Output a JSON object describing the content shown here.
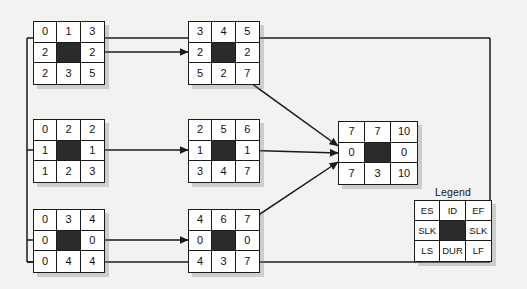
{
  "diagram": {
    "type": "activity-on-node-network",
    "title": "",
    "background_color": "#f2f2f0",
    "node_border_color": "#1a1a1a",
    "dark_cell_color": "#2b2b2b",
    "line_color": "#1a1a1a"
  },
  "legend": {
    "title": "Legend",
    "cells": [
      "ES",
      "ID",
      "EF",
      "SLK",
      "",
      "SLK",
      "LS",
      "DUR",
      "LF"
    ],
    "meaning": {
      "ES": "Early Start",
      "ID": "Identifier",
      "EF": "Early Finish",
      "SLK": "Slack",
      "LS": "Late Start",
      "DUR": "Duration",
      "LF": "Late Finish"
    }
  },
  "nodes": [
    {
      "name": "node-top-left",
      "cells": [
        "0",
        "1",
        "3",
        "2",
        "",
        "2",
        "2",
        "3",
        "5"
      ],
      "es": "0",
      "id": "1",
      "ef": "3",
      "slack_left": "2",
      "slack_right": "2",
      "ls": "2",
      "dur": "3",
      "lf": "5"
    },
    {
      "name": "node-top-center",
      "cells": [
        "3",
        "4",
        "5",
        "2",
        "",
        "2",
        "5",
        "2",
        "7"
      ],
      "es": "3",
      "id": "4",
      "ef": "5",
      "slack_left": "2",
      "slack_right": "2",
      "ls": "5",
      "dur": "2",
      "lf": "7"
    },
    {
      "name": "node-middle-left",
      "cells": [
        "0",
        "2",
        "2",
        "1",
        "",
        "1",
        "1",
        "2",
        "3"
      ],
      "es": "0",
      "id": "2",
      "ef": "2",
      "slack_left": "1",
      "slack_right": "1",
      "ls": "1",
      "dur": "2",
      "lf": "3"
    },
    {
      "name": "node-middle-center",
      "cells": [
        "2",
        "5",
        "6",
        "1",
        "",
        "1",
        "3",
        "4",
        "7"
      ],
      "es": "2",
      "id": "5",
      "ef": "6",
      "slack_left": "1",
      "slack_right": "1",
      "ls": "3",
      "dur": "4",
      "lf": "7"
    },
    {
      "name": "node-bottom-left",
      "cells": [
        "0",
        "3",
        "4",
        "0",
        "",
        "0",
        "0",
        "4",
        "4"
      ],
      "es": "0",
      "id": "3",
      "ef": "4",
      "slack_left": "0",
      "slack_right": "0",
      "ls": "0",
      "dur": "4",
      "lf": "4"
    },
    {
      "name": "node-bottom-center",
      "cells": [
        "4",
        "6",
        "7",
        "0",
        "",
        "0",
        "4",
        "3",
        "7"
      ],
      "es": "4",
      "id": "6",
      "ef": "7",
      "slack_left": "0",
      "slack_right": "0",
      "ls": "4",
      "dur": "3",
      "lf": "7"
    },
    {
      "name": "node-right",
      "cells": [
        "7",
        "7",
        "10",
        "0",
        "",
        "0",
        "7",
        "3",
        "10"
      ],
      "es": "7",
      "id": "7",
      "ef": "10",
      "slack_left": "0",
      "slack_right": "0",
      "ls": "7",
      "dur": "3",
      "lf": "10"
    }
  ]
}
